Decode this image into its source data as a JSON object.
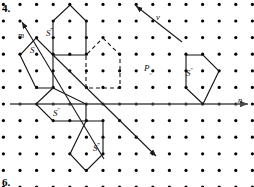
{
  "figure": {
    "item_number": "4.",
    "next_item_number": "6.",
    "grid": {
      "origin_x": 20,
      "origin_y": 104,
      "spacing_x": 16.6,
      "spacing_y": 16.6,
      "cols": 14,
      "rows": 11,
      "dot_radius": 1.6,
      "dot_color": "#000000"
    },
    "axis": {
      "color": "#4a4a4a",
      "label": "n",
      "label_x": 238,
      "label_y": 96,
      "y": 104,
      "x_start": 10,
      "x_end": 248
    },
    "vectors": [
      {
        "name": "m",
        "label": "m",
        "label_x": 18,
        "label_y": 31,
        "x1": 104,
        "y1": 159,
        "x2": 22,
        "y2": 22,
        "arrow_at": "end",
        "color": "#1a1a1a"
      },
      {
        "name": "v",
        "label": "v",
        "label_x": 156,
        "label_y": 13,
        "x1": 182,
        "y1": 42,
        "x2": 136,
        "y2": 6,
        "arrow_at": "end",
        "color": "#1a1a1a"
      },
      {
        "name": "m-extension",
        "label": "",
        "label_x": 0,
        "label_y": 0,
        "x1": 53,
        "y1": 55,
        "x2": 156,
        "y2": 156,
        "arrow_at": "end",
        "color": "#1a1a1a"
      }
    ],
    "polygons": [
      {
        "name": "S-triple-prime",
        "style": "solid",
        "label": "S",
        "label_primes": "‴",
        "label_x": 46,
        "label_y": 28,
        "points": "53,55 53,21 70,5 86,21 86,55"
      },
      {
        "name": "S-prime",
        "style": "solid",
        "label": "S",
        "label_primes": "′",
        "label_x": 30,
        "label_y": 45,
        "points": "53,55 53,88 36,88 20,55 36,38"
      },
      {
        "name": "S-double-prime-lower-left",
        "style": "solid",
        "label": "S",
        "label_primes": "″",
        "label_x": 53,
        "label_y": 108,
        "points": "53,88 86,104 86,121 53,121 36,104"
      },
      {
        "name": "S-quad-prime-bottom",
        "style": "solid",
        "label": "S",
        "label_primes": "‴",
        "label_x": 93,
        "label_y": 143,
        "points": "103,121 103,154 86,171 70,154 86,121"
      },
      {
        "name": "S-right",
        "style": "solid",
        "label": "S",
        "label_primes": "″",
        "label_x": 186,
        "label_y": 68,
        "points": "186,55 203,55 219,71 203,104 186,88"
      },
      {
        "name": "S-dashed",
        "style": "dashed",
        "label": "",
        "label_primes": "",
        "label_x": 0,
        "label_y": 0,
        "points": "103,38 120,55 120,88 86,88 86,55"
      }
    ],
    "point_labels": [
      {
        "name": "P-subscript",
        "base": "P",
        "sub": "₀",
        "x": 144,
        "y": 64
      }
    ]
  }
}
